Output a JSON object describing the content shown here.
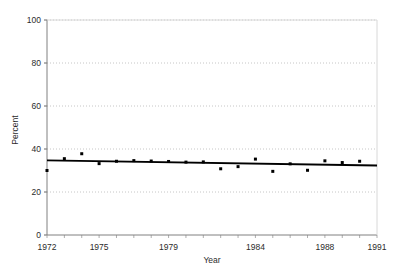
{
  "chart_data": {
    "type": "scatter",
    "title": "",
    "xlabel": "Year",
    "ylabel": "Percent",
    "xlim": [
      1972,
      1991
    ],
    "ylim": [
      0,
      100
    ],
    "grid": true,
    "legend": "none",
    "x_ticks": [
      1972,
      1973,
      1974,
      1975,
      1976,
      1977,
      1978,
      1979,
      1980,
      1981,
      1982,
      1983,
      1984,
      1985,
      1986,
      1987,
      1988,
      1989,
      1990,
      1991
    ],
    "x_tick_labels": [
      "1972",
      "",
      "",
      "1975",
      "",
      "",
      "",
      "1979",
      "",
      "",
      "",
      "",
      "1984",
      "",
      "",
      "",
      "1988",
      "",
      "",
      "1991"
    ],
    "x_labeled_ticks": [
      {
        "value": 1972,
        "label": "1972"
      },
      {
        "value": 1975,
        "label": "1975"
      },
      {
        "value": 1979,
        "label": "1979"
      },
      {
        "value": 1984,
        "label": "1984"
      },
      {
        "value": 1988,
        "label": "1988"
      },
      {
        "value": 1991,
        "label": "1991"
      }
    ],
    "y_ticks": [
      0,
      20,
      40,
      60,
      80,
      100
    ],
    "y_tick_labels": [
      "0",
      "20",
      "40",
      "60",
      "80",
      "100"
    ],
    "series": [
      {
        "name": "Percent",
        "marker": "square",
        "marker_color": "#000000",
        "x": [
          1972,
          1973,
          1974,
          1975,
          1976,
          1977,
          1978,
          1979,
          1980,
          1981,
          1982,
          1983,
          1984,
          1985,
          1986,
          1987,
          1988,
          1989,
          1990
        ],
        "values": [
          30.0,
          35.5,
          37.8,
          33.2,
          34.3,
          34.6,
          34.4,
          34.2,
          33.9,
          34.0,
          30.8,
          31.8,
          35.3,
          29.6,
          33.1,
          30.1,
          34.5,
          33.7,
          34.3
        ]
      },
      {
        "name": "Trend line",
        "type": "line",
        "line_color": "#000000",
        "x": [
          1972,
          1991
        ],
        "values": [
          34.7,
          32.3
        ]
      }
    ]
  },
  "axes": {
    "y_axis_title": "Percent",
    "x_axis_title": "Year"
  }
}
